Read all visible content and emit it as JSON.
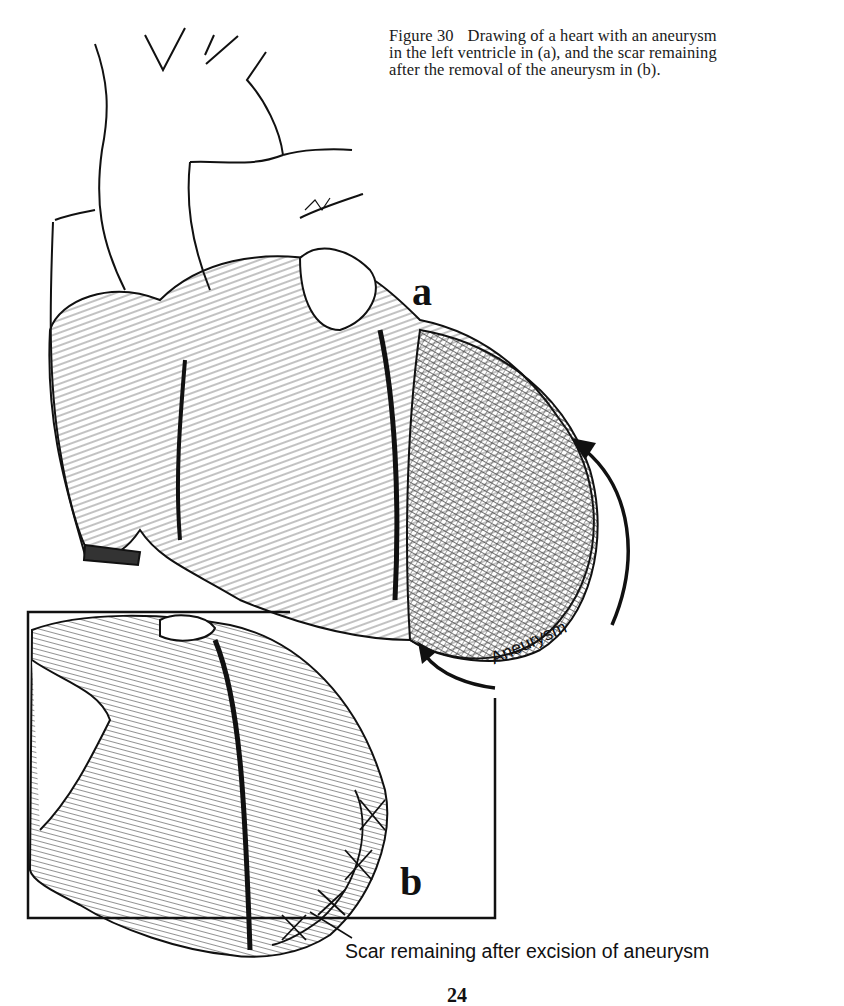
{
  "figure": {
    "number_label": "Figure 30",
    "caption_line1_rest": "Drawing of a heart with an aneurysm",
    "caption_line2": "in the left ventricle in (a), and the scar remaining",
    "caption_line3": "after the removal of the aneurysm in (b)."
  },
  "panels": {
    "a": {
      "label": "a",
      "description": "Heart with aneurysm in the left ventricle"
    },
    "b": {
      "label": "b",
      "description": "Heart after excision of the aneurysm, showing scar"
    }
  },
  "annotations": {
    "aneurysm_label": "Aneurysm",
    "scar_label": "Scar remaining after excision of aneurysm",
    "artist_signature": "Brit"
  },
  "page": {
    "number": "24"
  },
  "colors": {
    "ink": "#111111",
    "paper": "#ffffff"
  }
}
